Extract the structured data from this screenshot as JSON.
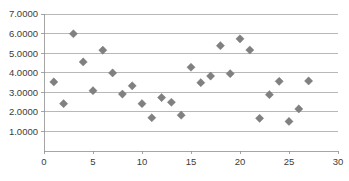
{
  "chart_data": {
    "type": "scatter",
    "title": "",
    "xlabel": "",
    "ylabel": "",
    "xlim": [
      0,
      30
    ],
    "ylim": [
      0,
      7
    ],
    "grid": true,
    "legend": false,
    "marker": {
      "shape": "diamond",
      "color": "#808080",
      "size": 5
    },
    "x_ticks": [
      0,
      5,
      10,
      15,
      20,
      25,
      30
    ],
    "x_tick_labels": [
      "0",
      "5",
      "10",
      "15",
      "20",
      "25",
      "30"
    ],
    "y_ticks": [
      1,
      2,
      3,
      4,
      5,
      6,
      7
    ],
    "y_tick_labels": [
      "1.0000",
      "2.0000",
      "3.0000",
      "4.0000",
      "5.0000",
      "6.0000",
      "7.0000"
    ],
    "x": [
      1,
      2,
      3,
      4,
      5,
      6,
      7,
      8,
      9,
      10,
      11,
      12,
      13,
      14,
      15,
      16,
      17,
      18,
      19,
      20,
      21,
      22,
      23,
      24,
      25,
      26,
      27
    ],
    "y": [
      3.53,
      2.42,
      5.99,
      4.55,
      3.08,
      5.15,
      3.99,
      2.91,
      3.33,
      2.42,
      1.7,
      2.73,
      2.49,
      1.83,
      4.28,
      3.49,
      3.83,
      5.38,
      3.95,
      5.73,
      5.16,
      1.67,
      2.88,
      3.56,
      1.51,
      2.15,
      3.58
    ],
    "series": [
      {
        "name": "Series 1",
        "points": [
          {
            "x": 1,
            "y": 3.53
          },
          {
            "x": 2,
            "y": 2.42
          },
          {
            "x": 3,
            "y": 5.99
          },
          {
            "x": 4,
            "y": 4.55
          },
          {
            "x": 5,
            "y": 3.08
          },
          {
            "x": 6,
            "y": 5.15
          },
          {
            "x": 7,
            "y": 3.99
          },
          {
            "x": 8,
            "y": 2.91
          },
          {
            "x": 9,
            "y": 3.33
          },
          {
            "x": 10,
            "y": 2.42
          },
          {
            "x": 11,
            "y": 1.7
          },
          {
            "x": 12,
            "y": 2.73
          },
          {
            "x": 13,
            "y": 2.49
          },
          {
            "x": 14,
            "y": 1.83
          },
          {
            "x": 15,
            "y": 4.28
          },
          {
            "x": 16,
            "y": 3.49
          },
          {
            "x": 17,
            "y": 3.83
          },
          {
            "x": 18,
            "y": 5.38
          },
          {
            "x": 19,
            "y": 3.95
          },
          {
            "x": 20,
            "y": 5.73
          },
          {
            "x": 21,
            "y": 5.16
          },
          {
            "x": 22,
            "y": 1.67
          },
          {
            "x": 23,
            "y": 2.88
          },
          {
            "x": 24,
            "y": 3.56
          },
          {
            "x": 25,
            "y": 1.51
          },
          {
            "x": 26,
            "y": 2.15
          },
          {
            "x": 27,
            "y": 3.58
          }
        ]
      }
    ]
  },
  "geometry": {
    "plot_left": 44,
    "plot_right": 338,
    "plot_top": 14,
    "plot_bottom": 151
  }
}
